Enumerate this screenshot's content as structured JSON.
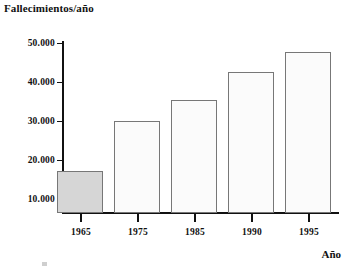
{
  "chart_data": {
    "type": "bar",
    "title": "Fallecimientos/año",
    "xlabel": "Año",
    "ylabel": "",
    "categories": [
      "1965",
      "1975",
      "1985",
      "1990",
      "1995"
    ],
    "values": [
      10700,
      23500,
      29000,
      36200,
      41300
    ],
    "ylim": [
      0,
      52000
    ],
    "yticks": [
      10000,
      20000,
      30000,
      40000,
      50000
    ],
    "ytick_labels": [
      "10.000",
      "20.000",
      "30.000",
      "40.000",
      "50.000"
    ],
    "grid": false,
    "legend": null,
    "bar_colors": [
      "#d6d6d6",
      "#fbfbfb",
      "#fbfbfb",
      "#fbfbfb",
      "#fbfbfb"
    ],
    "bar_edge_color": "#777777",
    "axis_color": "#111111"
  },
  "labels": {
    "title": "Fallecimientos/año",
    "x_axis_caption": "Año",
    "y_ticks": [
      "50.000",
      "40.000",
      "30.000",
      "20.000",
      "10.000"
    ],
    "x_ticks": [
      "1965",
      "1975",
      "1985",
      "1990",
      "1995"
    ]
  }
}
